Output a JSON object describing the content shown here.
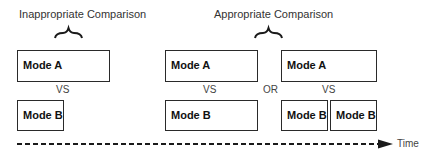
{
  "headings": {
    "inappropriate": "Inappropriate Comparison",
    "appropriate": "Appropriate Comparison"
  },
  "left": {
    "mode_a": "Mode A",
    "vs": "VS",
    "mode_b": "Mode B"
  },
  "middle": {
    "mode_a": "Mode A",
    "vs": "VS",
    "mode_b": "Mode B"
  },
  "or_label": "OR",
  "right": {
    "mode_a": "Mode A",
    "vs": "VS",
    "mode_b_1": "Mode B",
    "mode_b_2": "Mode B"
  },
  "timeline": {
    "label": "Time"
  },
  "colors": {
    "stroke": "#2a2a2a",
    "text": "#1a1a1a",
    "background": "#ffffff"
  }
}
